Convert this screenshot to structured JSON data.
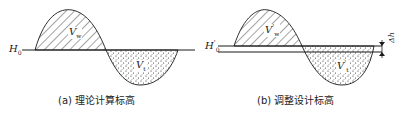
{
  "panels": [
    {
      "id": "a",
      "caption": "(a) 理论计算标高",
      "datum_label": "H",
      "datum_subscript": "0",
      "datum_prime": "",
      "fill_label": "V",
      "fill_subscript": "w",
      "cut_label": "V",
      "cut_subscript": "t"
    },
    {
      "id": "b",
      "caption": "(b) 调整设计标高",
      "datum_label": "H",
      "datum_subscript": "0",
      "datum_prime": "'",
      "fill_label": "V",
      "fill_subscript": "w",
      "fill_prime": "'",
      "cut_label": "V",
      "cut_subscript": "t",
      "cut_prime": "'",
      "offset_label": "Δh"
    }
  ],
  "colors": {
    "line": "#1a1a1a",
    "background": "#ffffff"
  }
}
